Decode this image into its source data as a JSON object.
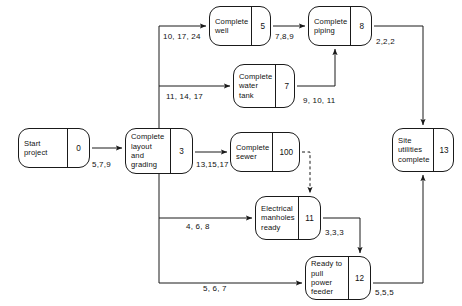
{
  "diagram": {
    "type": "activity-on-node-network",
    "stroke_color": "#1a1a1a",
    "text_color": "#111111",
    "background_color": "#ffffff",
    "nodes": [
      {
        "key": "start",
        "label": "Start\nproject",
        "id": "0",
        "x": 18,
        "y": 128,
        "w": 72,
        "h": 40
      },
      {
        "key": "layout",
        "label": "Complete\nlayout and\ngrading",
        "id": "3",
        "x": 125,
        "y": 128,
        "w": 68,
        "h": 46
      },
      {
        "key": "well",
        "label": "Complete\nwell",
        "id": "5",
        "x": 209,
        "y": 6,
        "w": 62,
        "h": 40
      },
      {
        "key": "piping",
        "label": "Complete\npiping",
        "id": "8",
        "x": 308,
        "y": 6,
        "w": 64,
        "h": 40
      },
      {
        "key": "watertank",
        "label": "Complete\nwater\ntank",
        "id": "7",
        "x": 233,
        "y": 64,
        "w": 62,
        "h": 44
      },
      {
        "key": "sewer",
        "label": "Complete\nsewer",
        "id": "100",
        "x": 230,
        "y": 132,
        "w": 70,
        "h": 40
      },
      {
        "key": "manholes",
        "label": "Electrical\nmanholes\nready",
        "id": "11",
        "x": 255,
        "y": 196,
        "w": 66,
        "h": 44
      },
      {
        "key": "feeder",
        "label": "Ready to\npull power\nfeeder",
        "id": "12",
        "x": 305,
        "y": 256,
        "w": 66,
        "h": 44
      },
      {
        "key": "site",
        "label": "Site\nutilities\ncomplete",
        "id": "13",
        "x": 392,
        "y": 128,
        "w": 62,
        "h": 44
      }
    ],
    "edges": [
      {
        "key": "start-layout",
        "from": "start",
        "to": "layout",
        "label": "5,7,9",
        "style": "solid"
      },
      {
        "key": "layout-well",
        "from": "layout",
        "to": "well",
        "label": "10, 17, 24",
        "style": "solid"
      },
      {
        "key": "layout-watertank",
        "from": "layout",
        "to": "watertank",
        "label": "11, 14, 17",
        "style": "solid"
      },
      {
        "key": "layout-sewer",
        "from": "layout",
        "to": "sewer",
        "label": "13,15,17",
        "style": "solid"
      },
      {
        "key": "layout-manholes",
        "from": "layout",
        "to": "manholes",
        "label": "4, 6, 8",
        "style": "solid"
      },
      {
        "key": "layout-feeder",
        "from": "layout",
        "to": "feeder",
        "label": "5, 6, 7",
        "style": "solid"
      },
      {
        "key": "well-piping",
        "from": "well",
        "to": "piping",
        "label": "7,8,9",
        "style": "solid"
      },
      {
        "key": "watertank-piping",
        "from": "watertank",
        "to": "piping",
        "label": "9, 10, 11",
        "style": "solid"
      },
      {
        "key": "piping-site",
        "from": "piping",
        "to": "site",
        "label": "2,2,2",
        "style": "solid"
      },
      {
        "key": "sewer-manholes",
        "from": "sewer",
        "to": "manholes",
        "label": "",
        "style": "dashed"
      },
      {
        "key": "manholes-feeder",
        "from": "manholes",
        "to": "feeder",
        "label": "3,3,3",
        "style": "solid"
      },
      {
        "key": "feeder-site",
        "from": "feeder",
        "to": "site",
        "label": "5,5,5",
        "style": "solid"
      }
    ],
    "edge_label_positions": [
      {
        "key": "start-layout",
        "x": 92,
        "y": 160
      },
      {
        "key": "layout-well",
        "x": 163,
        "y": 32
      },
      {
        "key": "layout-watertank",
        "x": 166,
        "y": 92
      },
      {
        "key": "layout-sewer",
        "x": 196,
        "y": 160
      },
      {
        "key": "layout-manholes",
        "x": 186,
        "y": 222
      },
      {
        "key": "layout-feeder",
        "x": 203,
        "y": 284
      },
      {
        "key": "well-piping",
        "x": 275,
        "y": 32
      },
      {
        "key": "watertank-piping",
        "x": 303,
        "y": 96
      },
      {
        "key": "piping-site",
        "x": 376,
        "y": 37
      },
      {
        "key": "manholes-feeder",
        "x": 325,
        "y": 228
      },
      {
        "key": "feeder-site",
        "x": 375,
        "y": 288
      }
    ]
  }
}
